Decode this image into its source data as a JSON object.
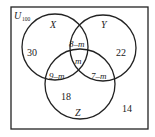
{
  "diagram": {
    "type": "venn",
    "universe": {
      "label": "U",
      "subscript": "100"
    },
    "sets": [
      {
        "name": "X"
      },
      {
        "name": "Y"
      },
      {
        "name": "Z"
      }
    ],
    "regions": {
      "x_only": "30",
      "y_only": "22",
      "z_only": "18",
      "x_y_only": "8–m",
      "x_z_only": "9–m",
      "y_z_only": "7–m",
      "x_y_z": "m",
      "outside": "14"
    },
    "colors": {
      "stroke": "#222222",
      "background": "#ffffff"
    }
  }
}
